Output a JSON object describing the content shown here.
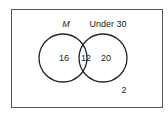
{
  "diagram": {
    "type": "venn",
    "sets": [
      {
        "name": "M",
        "only_count": "16"
      },
      {
        "name": "Under 30",
        "only_count": "20"
      }
    ],
    "intersection_count": "12",
    "outside_count": "2"
  },
  "colors": {
    "stroke": "#222222",
    "background": "#ffffff"
  }
}
